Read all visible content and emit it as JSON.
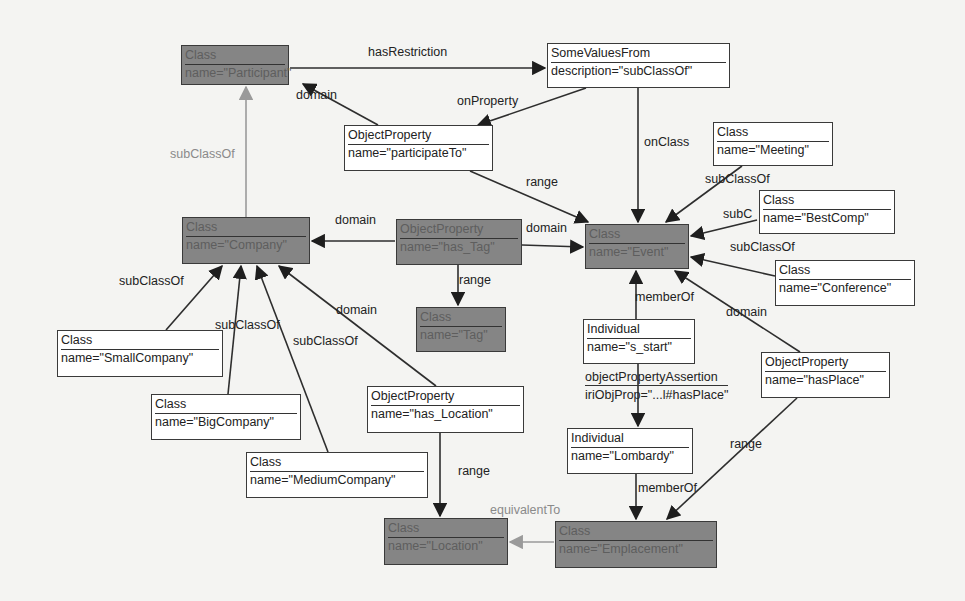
{
  "diagram": {
    "nodes": [
      {
        "id": "participant",
        "type": "Class",
        "attr": "name=\"Participant\"",
        "dark": true,
        "x": 181,
        "y": 45,
        "w": 108,
        "h": 40
      },
      {
        "id": "somevalues",
        "type": "SomeValuesFrom",
        "attr": "description=\"subClassOf\"",
        "dark": false,
        "x": 547,
        "y": 43,
        "w": 183,
        "h": 45
      },
      {
        "id": "participateTo",
        "type": "ObjectProperty",
        "attr": "name=\"participateTo\"",
        "dark": false,
        "x": 344,
        "y": 125,
        "w": 149,
        "h": 46
      },
      {
        "id": "meeting",
        "type": "Class",
        "attr": "name=\"Meeting\"",
        "dark": false,
        "x": 713,
        "y": 122,
        "w": 120,
        "h": 44
      },
      {
        "id": "bestcomp",
        "type": "Class",
        "attr": "name=\"BestComp\"",
        "dark": false,
        "x": 759,
        "y": 190,
        "w": 136,
        "h": 44
      },
      {
        "id": "company",
        "type": "Class",
        "attr": "name=\"Company\"",
        "dark": true,
        "x": 182,
        "y": 217,
        "w": 128,
        "h": 47
      },
      {
        "id": "hastag",
        "type": "ObjectProperty",
        "attr": "name=\"has_Tag\"",
        "dark": true,
        "x": 396,
        "y": 219,
        "w": 126,
        "h": 46
      },
      {
        "id": "event",
        "type": "Class",
        "attr": "name=\"Event\"",
        "dark": true,
        "x": 585,
        "y": 224,
        "w": 104,
        "h": 45
      },
      {
        "id": "conference",
        "type": "Class",
        "attr": "name=\"Conference\"",
        "dark": false,
        "x": 775,
        "y": 260,
        "w": 140,
        "h": 46
      },
      {
        "id": "tag",
        "type": "Class",
        "attr": "name=\"Tag\"",
        "dark": true,
        "x": 416,
        "y": 307,
        "w": 90,
        "h": 45
      },
      {
        "id": "smallcompany",
        "type": "Class",
        "attr": "name=\"SmallCompany\"",
        "dark": false,
        "x": 57,
        "y": 330,
        "w": 166,
        "h": 47
      },
      {
        "id": "s_start",
        "type": "Individual",
        "attr": "name=\"s_start\"",
        "dark": false,
        "x": 583,
        "y": 319,
        "w": 112,
        "h": 45
      },
      {
        "id": "hasplace",
        "type": "ObjectProperty",
        "attr": "name=\"hasPlace\"",
        "dark": false,
        "x": 761,
        "y": 352,
        "w": 129,
        "h": 46
      },
      {
        "id": "bigcompany",
        "type": "Class",
        "attr": "name=\"BigCompany\"",
        "dark": false,
        "x": 151,
        "y": 394,
        "w": 150,
        "h": 46
      },
      {
        "id": "haslocation",
        "type": "ObjectProperty",
        "attr": "name=\"has_Location\"",
        "dark": false,
        "x": 367,
        "y": 386,
        "w": 157,
        "h": 47
      },
      {
        "id": "lombardy",
        "type": "Individual",
        "attr": "name=\"Lombardy\"",
        "dark": false,
        "x": 567,
        "y": 428,
        "w": 126,
        "h": 46
      },
      {
        "id": "mediumcompany",
        "type": "Class",
        "attr": "name=\"MediumCompany\"",
        "dark": false,
        "x": 246,
        "y": 452,
        "w": 182,
        "h": 46
      },
      {
        "id": "location",
        "type": "Class",
        "attr": "name=\"Location\"",
        "dark": true,
        "x": 384,
        "y": 518,
        "w": 124,
        "h": 47
      },
      {
        "id": "emplacement",
        "type": "Class",
        "attr": "name=\"Emplacement\"",
        "dark": true,
        "x": 555,
        "y": 521,
        "w": 162,
        "h": 47
      }
    ],
    "assertion": {
      "title": "objectPropertyAssertion",
      "value": "iriObjProp=\"...l#hasPlace\"",
      "x": 585,
      "y": 370
    },
    "edges": [
      {
        "from": [
          290,
          68
        ],
        "to": [
          545,
          68
        ],
        "gray": false
      },
      {
        "from": [
          378,
          125
        ],
        "to": [
          303,
          84
        ],
        "gray": false
      },
      {
        "from": [
          586,
          88
        ],
        "to": [
          478,
          125
        ],
        "gray": false
      },
      {
        "from": [
          638,
          88
        ],
        "to": [
          638,
          222
        ],
        "gray": false
      },
      {
        "from": [
          470,
          171
        ],
        "to": [
          588,
          222
        ],
        "gray": false
      },
      {
        "from": [
          742,
          166
        ],
        "to": [
          666,
          222
        ],
        "gray": false
      },
      {
        "from": [
          757,
          220
        ],
        "to": [
          691,
          236
        ],
        "gray": false
      },
      {
        "from": [
          775,
          276
        ],
        "to": [
          691,
          257
        ],
        "gray": false
      },
      {
        "from": [
          246,
          217
        ],
        "to": [
          246,
          87
        ],
        "gray": true
      },
      {
        "from": [
          395,
          241
        ],
        "to": [
          312,
          241
        ],
        "gray": false
      },
      {
        "from": [
          522,
          245
        ],
        "to": [
          583,
          247
        ],
        "gray": false
      },
      {
        "from": [
          458,
          265
        ],
        "to": [
          458,
          305
        ],
        "gray": false
      },
      {
        "from": [
          166,
          330
        ],
        "to": [
          222,
          266
        ],
        "gray": false
      },
      {
        "from": [
          228,
          394
        ],
        "to": [
          241,
          266
        ],
        "gray": false
      },
      {
        "from": [
          328,
          452
        ],
        "to": [
          257,
          266
        ],
        "gray": false
      },
      {
        "from": [
          436,
          386
        ],
        "to": [
          279,
          266
        ],
        "gray": false
      },
      {
        "from": [
          636,
          319
        ],
        "to": [
          636,
          271
        ],
        "gray": false
      },
      {
        "from": [
          800,
          352
        ],
        "to": [
          675,
          271
        ],
        "gray": false
      },
      {
        "from": [
          638,
          364
        ],
        "to": [
          638,
          426
        ],
        "gray": false
      },
      {
        "from": [
          440,
          433
        ],
        "to": [
          440,
          516
        ],
        "gray": false
      },
      {
        "from": [
          636,
          474
        ],
        "to": [
          636,
          519
        ],
        "gray": false
      },
      {
        "from": [
          797,
          398
        ],
        "to": [
          667,
          519
        ],
        "gray": false
      },
      {
        "from": [
          554,
          542
        ],
        "to": [
          510,
          542
        ],
        "gray": true
      }
    ],
    "labels": [
      {
        "text": "hasRestriction",
        "x": 368,
        "y": 45,
        "gray": false
      },
      {
        "text": "domain",
        "x": 296,
        "y": 88,
        "gray": false
      },
      {
        "text": "onProperty",
        "x": 457,
        "y": 94,
        "gray": false
      },
      {
        "text": "subClassOf",
        "x": 170,
        "y": 147,
        "gray": true
      },
      {
        "text": "onClass",
        "x": 644,
        "y": 135,
        "gray": false
      },
      {
        "text": "range",
        "x": 526,
        "y": 175,
        "gray": false
      },
      {
        "text": "subClassOf",
        "x": 705,
        "y": 172,
        "gray": false
      },
      {
        "text": "subC",
        "x": 723,
        "y": 207,
        "gray": false
      },
      {
        "text": "subClassOf",
        "x": 730,
        "y": 240,
        "gray": false
      },
      {
        "text": "domain",
        "x": 335,
        "y": 213,
        "gray": false
      },
      {
        "text": "domain",
        "x": 526,
        "y": 221,
        "gray": false
      },
      {
        "text": "range",
        "x": 459,
        "y": 273,
        "gray": false
      },
      {
        "text": "memberOf",
        "x": 635,
        "y": 290,
        "gray": false
      },
      {
        "text": "domain",
        "x": 726,
        "y": 305,
        "gray": false
      },
      {
        "text": "subClassOf",
        "x": 119,
        "y": 274,
        "gray": false
      },
      {
        "text": "domain",
        "x": 336,
        "y": 303,
        "gray": false
      },
      {
        "text": "subClassOf",
        "x": 215,
        "y": 318,
        "gray": false
      },
      {
        "text": "subClassOf",
        "x": 293,
        "y": 334,
        "gray": false
      },
      {
        "text": "range",
        "x": 458,
        "y": 464,
        "gray": false
      },
      {
        "text": "range",
        "x": 730,
        "y": 437,
        "gray": false
      },
      {
        "text": "memberOf",
        "x": 638,
        "y": 481,
        "gray": false
      },
      {
        "text": "equivalentTo",
        "x": 490,
        "y": 503,
        "gray": true
      }
    ],
    "colors": {
      "dark_fill": "#858585",
      "line": "#2e2e2e",
      "gray_line": "#9a9a9a",
      "background": "#f4f4f2"
    }
  }
}
